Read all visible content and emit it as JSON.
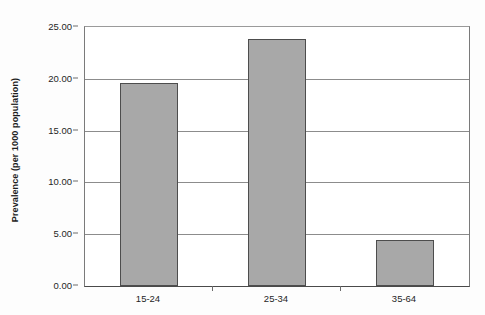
{
  "chart_data": {
    "type": "bar",
    "title": "",
    "subtitle": "",
    "xlabel": "",
    "ylabel": "Prevalence (per 1000 population)",
    "categories": [
      "15-24",
      "25-34",
      "35-64"
    ],
    "values": [
      19.6,
      23.8,
      4.4
    ],
    "ylim": [
      0.0,
      25.0
    ],
    "ytick_values": [
      0.0,
      5.0,
      10.0,
      15.0,
      20.0,
      25.0
    ],
    "ytick_labels": [
      "0.00",
      "5.00",
      "10.00",
      "15.00",
      "20.00",
      "25.00"
    ],
    "grid": "horizontal",
    "legend": "none",
    "bar_fill_color": "#a8a8a8",
    "bar_border_color": "#4d4d4d",
    "gridline_color": "#8c8c8c",
    "axis_color": "#4a4a4a",
    "text_color": "#1f1f1f",
    "background_color": "#ffffff"
  }
}
